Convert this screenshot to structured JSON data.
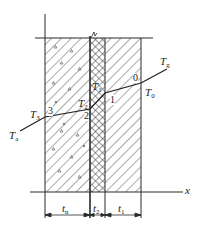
{
  "diagram": {
    "title": "",
    "type": "multi-layer wall temperature profile",
    "colors": {
      "line": "#2a2a2a",
      "hatch": "#555555",
      "background": "#ffffff"
    },
    "layers": [
      {
        "id": "tn",
        "label_main": "t",
        "label_sub": "n",
        "x0": 45,
        "x1": 90,
        "pattern": "diagonal-with-aggregate"
      },
      {
        "id": "t2",
        "label_main": "t",
        "label_sub": "2",
        "x0": 90,
        "x1": 105,
        "pattern": "crosshatch"
      },
      {
        "id": "t1",
        "label_main": "t",
        "label_sub": "1",
        "x0": 105,
        "x1": 141,
        "pattern": "diagonal"
      }
    ],
    "axis": {
      "x_label": "x",
      "y_top": 14,
      "x_axis_y": 192,
      "x_axis_end": 183
    },
    "top_line_y": 38,
    "temperature_profile": {
      "points": [
        {
          "name": "T_a",
          "x": 20,
          "y": 131
        },
        {
          "name": "3",
          "x": 45,
          "y": 117
        },
        {
          "name": "2",
          "x": 90,
          "y": 109
        },
        {
          "name": "1",
          "x": 105,
          "y": 93
        },
        {
          "name": "0",
          "x": 141,
          "y": 83
        },
        {
          "name": "T_g",
          "x": 167,
          "y": 69
        }
      ]
    },
    "labels": {
      "Tg": {
        "main": "T",
        "sub": "g"
      },
      "T0": {
        "main": "T",
        "sub": "0"
      },
      "T1": {
        "main": "T",
        "sub": "1"
      },
      "T2": {
        "main": "T",
        "sub": "2"
      },
      "T3": {
        "main": "T",
        "sub": "3"
      },
      "Ta": {
        "main": "T",
        "sub": "a"
      },
      "n0": "0",
      "n1": "1",
      "n2": "2",
      "n3": "3",
      "x": "x"
    }
  }
}
